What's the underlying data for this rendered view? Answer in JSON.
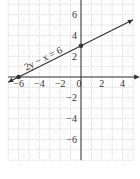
{
  "chart_data": {
    "type": "line",
    "title": "",
    "xlabel": "x",
    "ylabel": "",
    "xlim": [
      -7,
      5
    ],
    "ylim": [
      -8,
      7
    ],
    "grid": true,
    "x_ticks": [
      -6,
      -4,
      -2,
      0,
      2,
      4
    ],
    "y_ticks": [
      6,
      4,
      2,
      -2,
      -4,
      -6
    ],
    "x_tick_labels": [
      "−6",
      "−4",
      "−2",
      "0",
      "2",
      "4"
    ],
    "y_tick_labels": [
      "6",
      "4",
      "2",
      "−2",
      "−4",
      "−6"
    ],
    "series": [
      {
        "name": "2y − x = 6",
        "equation": "2y − x = 6",
        "x": [
          -7,
          5
        ],
        "y": [
          -0.5,
          5.5
        ],
        "marked_points": [
          [
            -6,
            0
          ],
          [
            0,
            3
          ]
        ],
        "color": "#333333"
      }
    ],
    "annotations": [
      {
        "text": "2y − x = 6",
        "x": -3.5,
        "y": 1.5,
        "rotated": true
      }
    ],
    "legend": null
  },
  "colors": {
    "axis": "#333333",
    "grid": "#bbbbbb",
    "line": "#333333",
    "text": "#333333"
  }
}
